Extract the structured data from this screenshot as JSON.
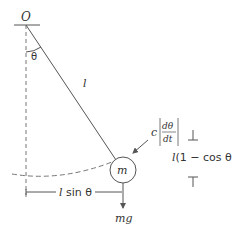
{
  "diagram": {
    "labels": {
      "pivot": "O",
      "angle": "θ",
      "length": "l",
      "mass": "m",
      "damping_coefficient": "c",
      "damping_numerator": "dθ",
      "damping_denominator": "dt",
      "gravity": "mg",
      "horizontal_dim_l": "l",
      "horizontal_dim_rest": " sin θ",
      "vertical_dim_l": "l",
      "vertical_dim_rest": "(1 − cos θ)"
    },
    "colors": {
      "line": "#555555",
      "text": "#333333",
      "background": "#ffffff"
    }
  }
}
